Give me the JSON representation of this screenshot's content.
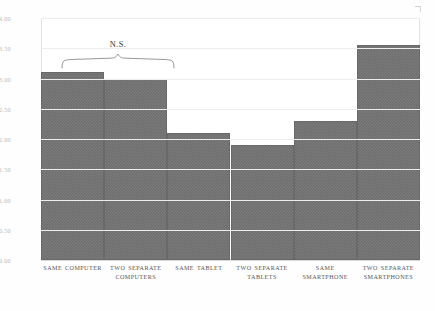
{
  "chart_data": {
    "type": "bar",
    "title": "",
    "subtitle": "",
    "xlabel": "",
    "ylabel": "",
    "ylim": [
      0.0,
      4.0
    ],
    "grid": true,
    "legend": null,
    "legend_position": "none",
    "bar_color": "#706f70",
    "categories": [
      "SAME COMPUTER",
      "TWO SEPARATE COMPUTERS",
      "SAME TABLET",
      "TWO SEPARATE TABLETS",
      "SAME SMARTPHONE",
      "TWO SEPARATE SMARTPHONES"
    ],
    "values": [
      3.1,
      3.0,
      2.1,
      1.9,
      2.3,
      3.55
    ],
    "ytick_labels": [
      "4.00",
      "3.50",
      "3.00",
      "2.50",
      "2.00",
      "1.50",
      "1.00",
      "0.50",
      "0.00"
    ],
    "ytick_values": [
      4.0,
      3.5,
      3.0,
      2.5,
      2.0,
      1.5,
      1.0,
      0.5,
      0.0
    ],
    "annotations": [
      {
        "text": "N.S.",
        "type": "significance-bracket",
        "spans": [
          "SAME COMPUTER",
          "TWO SEPARATE COMPUTERS"
        ]
      }
    ]
  }
}
